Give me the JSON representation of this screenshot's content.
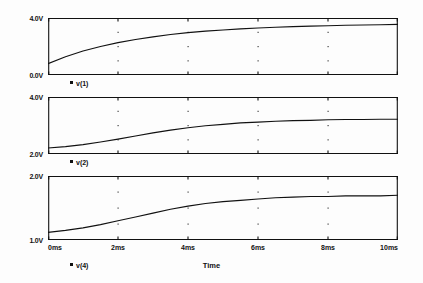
{
  "chart_data": {
    "type": "line",
    "title": "",
    "subtitle": "",
    "xlabel": "Time",
    "ylabel": "",
    "grid": "dotted-interior",
    "legend_position": "below-each-panel",
    "x": [
      0,
      0.5,
      1,
      1.5,
      2,
      2.5,
      3,
      3.5,
      4,
      4.5,
      5,
      5.5,
      6,
      6.5,
      7,
      7.5,
      8,
      8.5,
      9,
      9.5,
      10
    ],
    "x_unit": "ms",
    "xlim": [
      0,
      10
    ],
    "x_ticks": [
      0,
      2,
      4,
      6,
      8,
      10
    ],
    "x_tick_labels": [
      "0ms",
      "2ms",
      "4ms",
      "6ms",
      "8ms",
      "10ms"
    ],
    "panels": [
      {
        "id": "panel-1",
        "trace_name": "v(1)",
        "ylim": [
          0.0,
          4.0
        ],
        "y_ticks": [
          0.0,
          4.0
        ],
        "y_tick_labels": [
          "0.0V",
          "4.0V"
        ],
        "values": [
          0.8,
          1.28,
          1.68,
          2.0,
          2.27,
          2.49,
          2.68,
          2.84,
          2.97,
          3.08,
          3.16,
          3.24,
          3.3,
          3.35,
          3.39,
          3.43,
          3.46,
          3.49,
          3.51,
          3.53,
          3.55
        ]
      },
      {
        "id": "panel-2",
        "trace_name": "v(2)",
        "ylim": [
          2.0,
          4.0
        ],
        "y_ticks": [
          2.0,
          4.0
        ],
        "y_tick_labels": [
          "2.0V",
          "4.0V"
        ],
        "values": [
          2.21,
          2.26,
          2.33,
          2.42,
          2.52,
          2.63,
          2.74,
          2.84,
          2.92,
          2.99,
          3.04,
          3.09,
          3.12,
          3.15,
          3.17,
          3.18,
          3.2,
          3.21,
          3.21,
          3.22,
          3.22
        ]
      },
      {
        "id": "panel-3",
        "trace_name": "v(4)",
        "ylim": [
          1.0,
          2.0
        ],
        "y_ticks": [
          1.0,
          2.0
        ],
        "y_tick_labels": [
          "1.0V",
          "2.0V"
        ],
        "values": [
          1.12,
          1.15,
          1.19,
          1.24,
          1.3,
          1.36,
          1.42,
          1.48,
          1.53,
          1.57,
          1.6,
          1.62,
          1.64,
          1.66,
          1.67,
          1.68,
          1.68,
          1.69,
          1.69,
          1.69,
          1.7
        ]
      }
    ]
  },
  "colors": {
    "trace": "#111111",
    "axis": "#111111",
    "grid_dot": "#444444",
    "background": "#fdfdfd"
  }
}
